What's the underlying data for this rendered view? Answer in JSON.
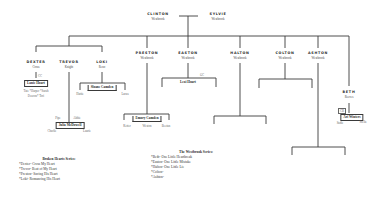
{
  "parents": {
    "father": {
      "name": "CLINTON",
      "surname": "Westbrook"
    },
    "mother": {
      "name": "SYLVIE",
      "surname": "Westbrook"
    }
  },
  "children": [
    {
      "name": "DEXTER",
      "surname": "Cross"
    },
    {
      "name": "TREVOR",
      "surname": "Knight"
    },
    {
      "name": "LOKI",
      "surname": "Reno"
    },
    {
      "name": "PRESTON",
      "surname": "Westbrook"
    },
    {
      "name": "EASTON",
      "surname": "Westbrook"
    },
    {
      "name": "HALTON",
      "surname": "Westbrook"
    },
    {
      "name": "COLTON",
      "surname": "Westbrook"
    },
    {
      "name": "ASHTON",
      "surname": "Westbrook"
    },
    {
      "name": "BETH",
      "surname": "Reeves"
    }
  ],
  "spouses": {
    "dexter": {
      "name": "Lanie Hoart",
      "tag": "CC",
      "kids_line1": "Tate *Harper *Sarah",
      "kids_line2": "Deacon* Tori"
    },
    "loki": {
      "name": "Sloane Camden",
      "kids": [
        "Hattie",
        "Lucas"
      ]
    },
    "trevor": {
      "name": "Julia McDowell",
      "tags": [
        "Pipe",
        "Abbie"
      ],
      "kids": [
        "Charlie",
        "Laurie"
      ]
    },
    "preston": {
      "name": "Emory Camden",
      "kids": [
        "Ketter",
        "Weston",
        "Beetan"
      ]
    },
    "easton": {
      "name": "Lexi Hoart",
      "tag": "GC"
    },
    "beth": {
      "name": "Ari Winters",
      "tag": "CB",
      "kids": [
        "Sadie",
        "Stella"
      ]
    }
  },
  "legends": {
    "broken_hearts": {
      "title": "Broken Hearts Series:",
      "items": [
        "*Dexter- Cross My Heart",
        "*Trevor- Beat of My Heart",
        "*Preston- Saving His Heart",
        "*Loki- Romancing His Heart"
      ]
    },
    "westbrook": {
      "title": "The Westbrook Series:",
      "items": [
        "*Beth- One Little Heartbreak",
        "*Easton- One Little Mistake",
        "*Halton- One Little Lie",
        "*Colton-",
        "*Ashton-"
      ]
    }
  }
}
